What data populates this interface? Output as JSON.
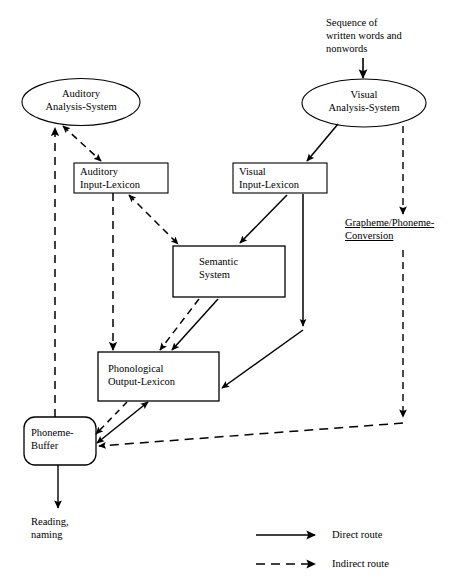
{
  "diagram": {
    "input_text": "Sequence of\nwritten words and\nnonwords",
    "output_text": "Reading,\nnaming",
    "nodes": {
      "auditory_analysis": "Auditory\nAnalysis-System",
      "visual_analysis": "Visual\nAnalysis-System",
      "auditory_input_lexicon": "Auditory\nInput-Lexicon",
      "visual_input_lexicon": "Visual\nInput-Lexicon",
      "semantic_system": "Semantic\nSystem",
      "phonological_output_lexicon": "Phonological\nOutput-Lexicon",
      "phoneme_buffer": "Phoneme-\nBuffer",
      "grapheme_phoneme_conversion": "Grapheme/Phoneme-\nConversion"
    },
    "legend": {
      "direct_label": "Direct route",
      "indirect_label": "Indirect route"
    },
    "colors": {
      "stroke": "#000000",
      "background": "#ffffff"
    }
  }
}
